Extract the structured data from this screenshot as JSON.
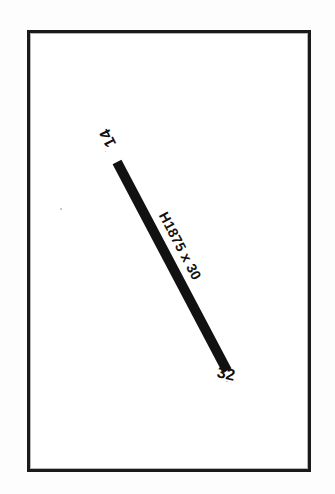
{
  "drawing": {
    "title": "Structural member detail",
    "frame": {
      "name": "drawing-border"
    },
    "member": {
      "label": "H1875 x 30",
      "section_designation": "H1875 x 30",
      "color": "#111111",
      "start_node": "14",
      "end_node": "32"
    },
    "nodes": [
      {
        "id": "14",
        "position": "start",
        "label": "14"
      },
      {
        "id": "32",
        "position": "end",
        "label": "32"
      }
    ],
    "colors": {
      "ink": "#111111",
      "paper": "#ffffff",
      "page": "#fdfdfd"
    }
  }
}
